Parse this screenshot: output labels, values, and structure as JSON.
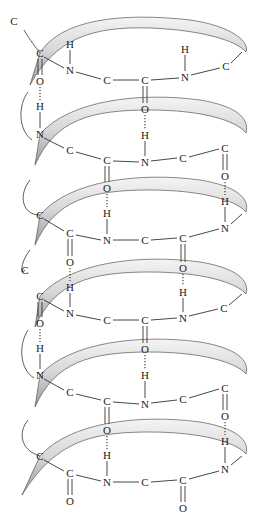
{
  "diagram": {
    "title": "",
    "ribbon_color": "#b8b8b8",
    "ribbon_highlight": "#f2f2f2",
    "atoms": [
      {
        "label": "C",
        "x": 14,
        "y": 21
      },
      {
        "label": "C",
        "x": 40,
        "y": 53
      },
      {
        "label": "H",
        "x": 70,
        "y": 44
      },
      {
        "label": "N",
        "x": 70,
        "y": 70
      },
      {
        "label": "C",
        "x": 107,
        "y": 80
      },
      {
        "label": "C",
        "x": 145,
        "y": 80
      },
      {
        "label": "H",
        "x": 185,
        "y": 49
      },
      {
        "label": "N",
        "x": 185,
        "y": 77
      },
      {
        "label": "C",
        "x": 226,
        "y": 66
      },
      {
        "label": "O",
        "x": 40,
        "y": 81
      },
      {
        "label": "H",
        "x": 40,
        "y": 106
      },
      {
        "label": "O",
        "x": 145,
        "y": 109
      },
      {
        "label": "N",
        "x": 40,
        "y": 134
      },
      {
        "label": "H",
        "x": 145,
        "y": 135
      },
      {
        "label": "C",
        "x": 70,
        "y": 150
      },
      {
        "label": "C",
        "x": 107,
        "y": 160
      },
      {
        "label": "N",
        "x": 145,
        "y": 162
      },
      {
        "label": "C",
        "x": 183,
        "y": 158
      },
      {
        "label": "C",
        "x": 225,
        "y": 148
      },
      {
        "label": "O",
        "x": 107,
        "y": 188
      },
      {
        "label": "O",
        "x": 225,
        "y": 176
      },
      {
        "label": "C",
        "x": 40,
        "y": 215
      },
      {
        "label": "H",
        "x": 107,
        "y": 213
      },
      {
        "label": "H",
        "x": 225,
        "y": 201
      },
      {
        "label": "C",
        "x": 70,
        "y": 233
      },
      {
        "label": "N",
        "x": 107,
        "y": 240
      },
      {
        "label": "C",
        "x": 145,
        "y": 240
      },
      {
        "label": "C",
        "x": 183,
        "y": 238
      },
      {
        "label": "N",
        "x": 225,
        "y": 228
      },
      {
        "label": "C",
        "x": 25,
        "y": 270
      },
      {
        "label": "O",
        "x": 70,
        "y": 262
      },
      {
        "label": "O",
        "x": 183,
        "y": 268
      },
      {
        "label": "H",
        "x": 70,
        "y": 287
      },
      {
        "label": "H",
        "x": 183,
        "y": 292
      },
      {
        "label": "C",
        "x": 40,
        "y": 296
      },
      {
        "label": "N",
        "x": 70,
        "y": 313
      },
      {
        "label": "C",
        "x": 107,
        "y": 320
      },
      {
        "label": "C",
        "x": 145,
        "y": 320
      },
      {
        "label": "N",
        "x": 183,
        "y": 318
      },
      {
        "label": "C",
        "x": 224,
        "y": 308
      },
      {
        "label": "O",
        "x": 40,
        "y": 323
      },
      {
        "label": "O",
        "x": 145,
        "y": 349
      },
      {
        "label": "H",
        "x": 40,
        "y": 348
      },
      {
        "label": "N",
        "x": 40,
        "y": 375
      },
      {
        "label": "H",
        "x": 145,
        "y": 375
      },
      {
        "label": "C",
        "x": 70,
        "y": 392
      },
      {
        "label": "C",
        "x": 107,
        "y": 401
      },
      {
        "label": "N",
        "x": 145,
        "y": 404
      },
      {
        "label": "C",
        "x": 183,
        "y": 399
      },
      {
        "label": "C",
        "x": 225,
        "y": 388
      },
      {
        "label": "O",
        "x": 107,
        "y": 430
      },
      {
        "label": "O",
        "x": 225,
        "y": 416
      },
      {
        "label": "C",
        "x": 40,
        "y": 456
      },
      {
        "label": "H",
        "x": 107,
        "y": 455
      },
      {
        "label": "H",
        "x": 225,
        "y": 441
      },
      {
        "label": "C",
        "x": 70,
        "y": 473
      },
      {
        "label": "N",
        "x": 107,
        "y": 482
      },
      {
        "label": "C",
        "x": 145,
        "y": 482
      },
      {
        "label": "C",
        "x": 183,
        "y": 480
      },
      {
        "label": "N",
        "x": 225,
        "y": 469
      },
      {
        "label": "O",
        "x": 70,
        "y": 501
      },
      {
        "label": "O",
        "x": 183,
        "y": 508
      }
    ]
  }
}
